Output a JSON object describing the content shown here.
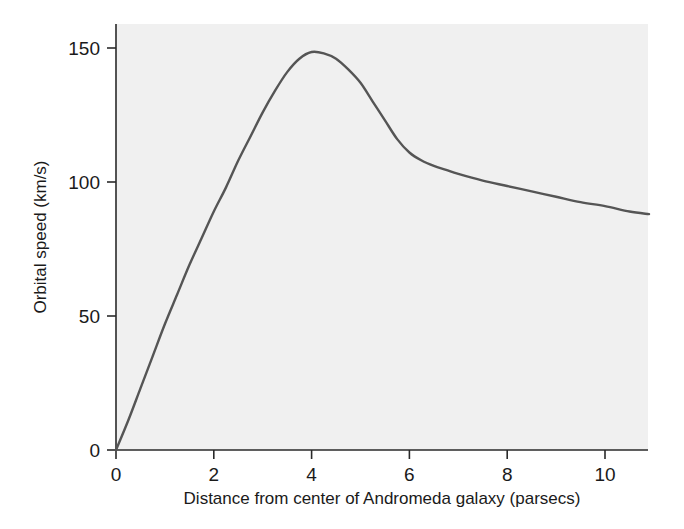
{
  "chart_data": {
    "type": "line",
    "title": "",
    "xlabel": "Distance from center of Andromeda galaxy (parsecs)",
    "ylabel": "Orbital speed (km/s)",
    "xlim": [
      0,
      10.9
    ],
    "ylim": [
      0,
      160
    ],
    "xticks": [
      0,
      2,
      4,
      6,
      8,
      10
    ],
    "xtick_labels": [
      "0",
      "2",
      "4",
      "6",
      "8",
      "10"
    ],
    "yticks": [
      0,
      50,
      100,
      150
    ],
    "ytick_labels": [
      "0",
      "50",
      "100",
      "150"
    ],
    "grid": false,
    "legend": "none",
    "series": [
      {
        "name": "Andromeda rotation curve",
        "color": "#555555",
        "x": [
          0.0,
          0.25,
          0.5,
          0.75,
          1.0,
          1.25,
          1.5,
          1.75,
          2.0,
          2.25,
          2.5,
          2.75,
          3.0,
          3.25,
          3.5,
          3.75,
          4.0,
          4.25,
          4.5,
          4.75,
          5.0,
          5.25,
          5.5,
          5.75,
          6.0,
          6.25,
          6.5,
          6.75,
          7.0,
          7.5,
          8.0,
          8.5,
          9.0,
          9.5,
          10.0,
          10.5,
          10.9
        ],
        "y": [
          0,
          11,
          23,
          35,
          47,
          58,
          69,
          79,
          89,
          98,
          108,
          117,
          126,
          134,
          141,
          146,
          148.5,
          148,
          146,
          142,
          137,
          130,
          123,
          116,
          111,
          108,
          106,
          104.5,
          103,
          100.5,
          98.5,
          96.5,
          94.5,
          92.5,
          91,
          89,
          88
        ]
      }
    ],
    "annotations": {
      "peak_x": 4.1,
      "peak_y": 148.5,
      "endpoint_x": 10.9,
      "endpoint_y": 88
    }
  },
  "style": {
    "plot_background": "#f0f0f0",
    "page_background": "#ffffff",
    "axis_color": "#2a2a2a",
    "curve_color": "#555555",
    "text_color": "#1a1a1a"
  }
}
